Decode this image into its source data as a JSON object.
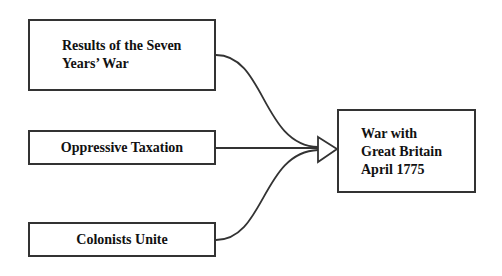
{
  "diagram": {
    "type": "cause-effect",
    "causes": [
      {
        "id": "cause-1",
        "label": "Results of the Seven Years’ War"
      },
      {
        "id": "cause-2",
        "label": "Oppressive Taxation"
      },
      {
        "id": "cause-3",
        "label": "Colonists Unite"
      }
    ],
    "effect": {
      "id": "effect",
      "label": "War with\nGreat Britain\nApril 1775"
    },
    "edges": [
      {
        "from": "cause-1",
        "to": "effect"
      },
      {
        "from": "cause-2",
        "to": "effect"
      },
      {
        "from": "cause-3",
        "to": "effect"
      }
    ],
    "colors": {
      "stroke": "#333333",
      "text": "#111111",
      "background": "#ffffff"
    }
  }
}
